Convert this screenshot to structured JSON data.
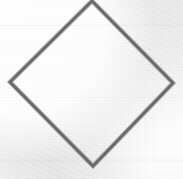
{
  "canvas": {
    "width": 183,
    "height": 179,
    "background_color": "#f4f4f4",
    "texture": "scanned-paper-grain"
  },
  "figure": {
    "name": "diamond-outline",
    "type": "polygon",
    "sides": 4,
    "stroke_color": "#6a6a6a",
    "stroke_width": 3,
    "fill": "none",
    "clipped_at_top_edge": true,
    "vertices": [
      {
        "label": "top",
        "x": 92,
        "y": 1
      },
      {
        "label": "right",
        "x": 173,
        "y": 83
      },
      {
        "label": "bottom",
        "x": 93,
        "y": 166
      },
      {
        "label": "left",
        "x": 10,
        "y": 82
      }
    ],
    "points_attr": "92,1 173,83 93,166 10,82",
    "center": {
      "x": 92,
      "y": 83
    },
    "diagonal_horizontal": 163,
    "diagonal_vertical": 165
  }
}
